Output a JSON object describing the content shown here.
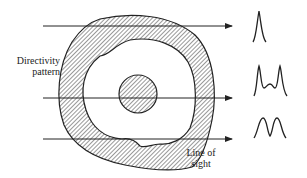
{
  "diagram": {
    "labels": {
      "directivity_line1": "Directivity",
      "directivity_line2": "pattern",
      "line_of_sight_line1": "Line of",
      "line_of_sight_line2": "sight"
    },
    "lines_of_sight": [
      {
        "id": "top",
        "y": 26,
        "signal": "single-peak"
      },
      {
        "id": "middle",
        "y": 98,
        "signal": "triple-peak"
      },
      {
        "id": "bottom",
        "y": 139,
        "signal": "double-peak"
      }
    ],
    "colors": {
      "stroke": "#222222",
      "background": "#ffffff"
    }
  }
}
